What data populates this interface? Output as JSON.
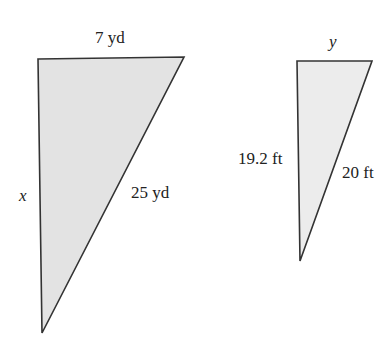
{
  "figure": {
    "colors": {
      "stroke": "#333333",
      "fill_large": "#e3e3e3",
      "fill_small": "#ececec",
      "text": "#222222"
    },
    "large_triangle": {
      "vertices": [
        [
          38,
          59
        ],
        [
          184,
          57
        ],
        [
          42,
          333
        ]
      ],
      "labels": {
        "top": "7 yd",
        "hypotenuse": "25 yd",
        "left": "x"
      }
    },
    "small_triangle": {
      "vertices": [
        [
          297,
          61
        ],
        [
          372,
          61
        ],
        [
          300,
          261
        ]
      ],
      "labels": {
        "top": "y",
        "left": "19.2 ft",
        "hypotenuse": "20 ft"
      }
    }
  }
}
